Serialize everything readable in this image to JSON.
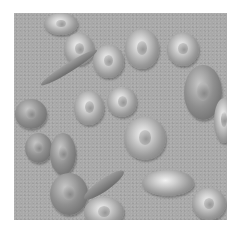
{
  "image": {
    "description": "Grayscale illustration of red blood cells including normal biconcave discs, elongated and sickle-shaped cells",
    "background_color": "#a9a9a9",
    "cells": [
      {
        "type": "normal",
        "x": 30,
        "y": 0,
        "w": 34,
        "h": 22
      },
      {
        "type": "normal",
        "x": 50,
        "y": 20,
        "w": 30,
        "h": 32
      },
      {
        "type": "normal",
        "x": 79,
        "y": 32,
        "w": 31,
        "h": 33
      },
      {
        "type": "normal",
        "x": 111,
        "y": 16,
        "w": 34,
        "h": 40
      },
      {
        "type": "normal",
        "x": 153,
        "y": 20,
        "w": 32,
        "h": 33
      },
      {
        "type": "dark",
        "x": 170,
        "y": 52,
        "w": 38,
        "h": 55
      },
      {
        "type": "normal",
        "x": 200,
        "y": 85,
        "w": 20,
        "h": 45
      },
      {
        "type": "normal",
        "x": 60,
        "y": 78,
        "w": 30,
        "h": 34
      },
      {
        "type": "normal",
        "x": 93,
        "y": 74,
        "w": 30,
        "h": 30
      },
      {
        "type": "dark",
        "x": 1,
        "y": 86,
        "w": 32,
        "h": 30
      },
      {
        "type": "normal",
        "x": 110,
        "y": 104,
        "w": 42,
        "h": 43
      },
      {
        "type": "dark",
        "x": 11,
        "y": 120,
        "w": 27,
        "h": 30
      },
      {
        "type": "dark",
        "x": 36,
        "y": 120,
        "w": 26,
        "h": 42
      },
      {
        "type": "plain",
        "x": 128,
        "y": 157,
        "w": 52,
        "h": 26
      },
      {
        "type": "dark",
        "x": 36,
        "y": 160,
        "w": 38,
        "h": 42
      },
      {
        "type": "normal",
        "x": 70,
        "y": 184,
        "w": 40,
        "h": 30
      },
      {
        "type": "normal",
        "x": 178,
        "y": 175,
        "w": 34,
        "h": 32
      }
    ],
    "sickle_cells": [
      {
        "x": 22,
        "y": 50,
        "w": 66,
        "h": 9,
        "rotate": -32
      },
      {
        "x": 66,
        "y": 166,
        "w": 48,
        "h": 12,
        "rotate": -35
      }
    ]
  }
}
